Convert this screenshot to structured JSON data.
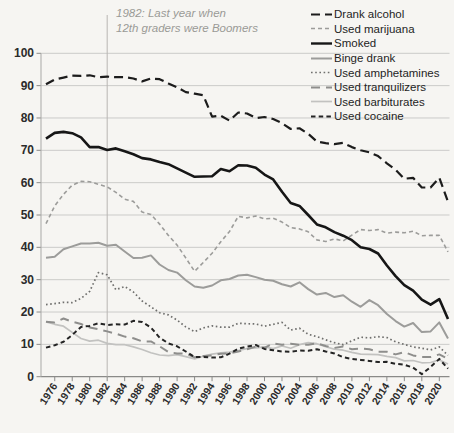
{
  "page": {
    "background": "#f6f5f2"
  },
  "chart_data": {
    "type": "line",
    "title": "",
    "xlabel": "",
    "ylabel": "",
    "ylim": [
      0,
      100
    ],
    "y_ticks": [
      0,
      10,
      20,
      30,
      40,
      50,
      60,
      70,
      80,
      90,
      100
    ],
    "x_tick_labels": [
      "1976",
      "1978",
      "1980",
      "1982",
      "1984",
      "1986",
      "1988",
      "1990",
      "1992",
      "1994",
      "1996",
      "1998",
      "2000",
      "2002",
      "2004",
      "2006",
      "2008",
      "2010",
      "2012",
      "2014",
      "2016",
      "2018",
      "2020"
    ],
    "x_years": [
      1975,
      1976,
      1977,
      1978,
      1979,
      1980,
      1981,
      1982,
      1983,
      1984,
      1985,
      1986,
      1987,
      1988,
      1989,
      1990,
      1991,
      1992,
      1993,
      1994,
      1995,
      1996,
      1997,
      1998,
      1999,
      2000,
      2001,
      2002,
      2003,
      2004,
      2005,
      2006,
      2007,
      2008,
      2009,
      2010,
      2011,
      2012,
      2013,
      2014,
      2015,
      2016,
      2017,
      2018,
      2019,
      2020,
      2021
    ],
    "grid": "horizontal-light",
    "legend_position": "top-right",
    "annotation": {
      "text_line1": "1982: Last year when",
      "text_line2": "12th graders were Boomers",
      "at_year": 1982
    },
    "series": [
      {
        "key": "drank_alcohol",
        "name": "Drank alcohol",
        "line_style": "long-dash",
        "color": "#1c1c1c",
        "width": 2.2,
        "dash": "9 5",
        "values": [
          90.4,
          91.9,
          92.5,
          93.1,
          93.0,
          93.2,
          92.6,
          92.8,
          92.6,
          92.6,
          92.2,
          91.3,
          92.2,
          92.0,
          90.7,
          89.5,
          88.0,
          87.5,
          87.0,
          80.4,
          80.7,
          79.2,
          81.7,
          81.4,
          80.0,
          80.3,
          79.7,
          78.4,
          76.6,
          76.8,
          75.1,
          72.7,
          72.2,
          71.9,
          72.3,
          71.0,
          70.0,
          69.4,
          68.2,
          66.0,
          64.0,
          61.2,
          61.5,
          58.5,
          58.5,
          61.5,
          54.1
        ]
      },
      {
        "key": "used_marijuana",
        "name": "Used marijuana",
        "line_style": "short-dash",
        "color": "#9c9c9a",
        "width": 1.6,
        "dash": "4 3",
        "values": [
          47.3,
          52.8,
          56.4,
          59.2,
          60.4,
          60.3,
          59.5,
          58.7,
          57.0,
          54.9,
          54.2,
          50.9,
          50.2,
          47.2,
          43.7,
          40.7,
          36.7,
          32.6,
          35.3,
          38.2,
          41.7,
          44.9,
          49.6,
          49.1,
          49.7,
          48.8,
          49.0,
          47.8,
          46.1,
          45.7,
          44.8,
          42.3,
          41.8,
          42.6,
          42.0,
          43.8,
          45.5,
          45.2,
          45.5,
          44.4,
          44.7,
          44.5,
          45.0,
          43.6,
          43.7,
          43.7,
          38.6
        ]
      },
      {
        "key": "smoked",
        "name": "Smoked",
        "line_style": "solid",
        "color": "#161616",
        "width": 2.6,
        "dash": "",
        "values": [
          73.6,
          75.4,
          75.7,
          75.3,
          74.0,
          71.0,
          71.0,
          70.1,
          70.6,
          69.7,
          68.8,
          67.6,
          67.2,
          66.4,
          65.7,
          64.4,
          63.1,
          61.8,
          61.9,
          62.0,
          64.2,
          63.5,
          65.4,
          65.3,
          64.6,
          62.5,
          61.0,
          57.2,
          53.7,
          52.8,
          50.0,
          47.1,
          46.2,
          44.7,
          43.6,
          42.2,
          40.0,
          39.5,
          38.1,
          34.4,
          31.1,
          28.3,
          26.6,
          23.8,
          22.3,
          24.0,
          17.8
        ]
      },
      {
        "key": "binge_drank",
        "name": "Binge drank",
        "line_style": "solid",
        "color": "#9c9c9a",
        "width": 2.0,
        "dash": "",
        "values": [
          36.8,
          37.1,
          39.4,
          40.3,
          41.2,
          41.2,
          41.4,
          40.5,
          40.8,
          38.7,
          36.7,
          36.8,
          37.5,
          34.7,
          33.0,
          32.2,
          29.8,
          27.9,
          27.5,
          28.2,
          29.8,
          30.2,
          31.3,
          31.5,
          30.8,
          30.0,
          29.7,
          28.6,
          27.9,
          29.2,
          27.1,
          25.4,
          25.9,
          24.6,
          25.2,
          23.2,
          21.6,
          23.7,
          22.1,
          19.4,
          17.2,
          15.5,
          16.6,
          13.8,
          14.0,
          16.8,
          11.8
        ]
      },
      {
        "key": "used_amphetamines",
        "name": "Used amphetamines",
        "line_style": "dotted",
        "color": "#6f6f6d",
        "width": 1.7,
        "dash": "1.6 2.6",
        "values": [
          22.3,
          22.6,
          23.0,
          22.9,
          24.2,
          26.4,
          32.2,
          31.5,
          26.9,
          27.9,
          26.2,
          23.4,
          21.6,
          19.8,
          19.1,
          17.5,
          15.4,
          13.9,
          15.1,
          15.7,
          15.3,
          15.3,
          16.5,
          16.4,
          16.3,
          15.6,
          16.2,
          16.8,
          14.4,
          15.0,
          13.1,
          12.4,
          11.4,
          10.5,
          9.9,
          11.1,
          12.2,
          12.0,
          12.4,
          12.1,
          10.8,
          10.0,
          9.2,
          8.8,
          8.3,
          9.2,
          6.6
        ]
      },
      {
        "key": "used_tranquilizers",
        "name": "Used tranquilizers",
        "line_style": "long-dash",
        "color": "#8e8e8c",
        "width": 2.0,
        "dash": "9 6",
        "values": [
          17.0,
          16.8,
          18.0,
          17.0,
          16.3,
          15.2,
          14.7,
          14.0,
          13.3,
          12.4,
          11.9,
          10.9,
          10.9,
          9.4,
          7.6,
          7.2,
          7.2,
          6.0,
          6.4,
          6.6,
          7.1,
          7.2,
          7.8,
          8.5,
          9.3,
          8.9,
          10.3,
          9.9,
          10.2,
          9.9,
          9.9,
          10.3,
          9.5,
          8.9,
          9.3,
          8.5,
          8.7,
          8.5,
          7.7,
          7.7,
          6.9,
          7.6,
          6.6,
          6.1,
          6.1,
          6.9,
          5.5
        ]
      },
      {
        "key": "used_barbiturates",
        "name": "Used barbiturates",
        "line_style": "solid",
        "color": "#c2c2c0",
        "width": 1.7,
        "dash": "",
        "values": [
          16.9,
          16.2,
          15.6,
          13.7,
          11.8,
          11.0,
          11.3,
          10.3,
          9.9,
          9.9,
          9.2,
          8.4,
          7.4,
          6.7,
          6.5,
          6.8,
          6.2,
          5.5,
          6.3,
          7.0,
          7.4,
          7.6,
          8.1,
          8.7,
          8.9,
          9.2,
          8.7,
          9.5,
          8.8,
          9.9,
          10.5,
          10.2,
          9.3,
          8.5,
          8.2,
          7.5,
          7.0,
          6.9,
          6.8,
          6.3,
          5.9,
          4.9,
          5.0,
          4.3,
          4.4,
          5.2,
          3.9
        ]
      },
      {
        "key": "used_cocaine",
        "name": "Used cocaine",
        "line_style": "short-dash",
        "color": "#242424",
        "width": 2.0,
        "dash": "4.5 3.2",
        "values": [
          9.0,
          9.7,
          10.8,
          12.9,
          15.4,
          15.7,
          16.5,
          16.0,
          16.2,
          16.1,
          17.3,
          16.9,
          15.2,
          12.1,
          10.3,
          9.4,
          7.8,
          6.1,
          6.1,
          5.9,
          6.0,
          7.1,
          8.7,
          9.3,
          9.8,
          8.6,
          8.2,
          7.8,
          7.7,
          8.1,
          8.0,
          8.5,
          7.8,
          7.2,
          6.0,
          5.5,
          5.2,
          4.9,
          4.5,
          4.6,
          4.0,
          3.7,
          2.8,
          0.8,
          3.0,
          5.5,
          2.5
        ]
      }
    ],
    "axis_colors": {
      "grid": "#cbcbc9",
      "axis": "#8a8a88",
      "annotation_line": "#b8b6b2"
    }
  }
}
